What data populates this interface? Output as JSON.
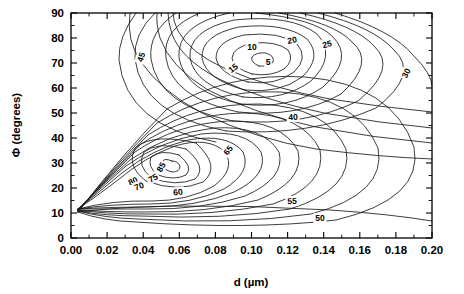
{
  "figure": {
    "background": "#ffffff",
    "line_color": "#1a1a1a",
    "plot_box": {
      "left": 71,
      "right": 432,
      "top": 13,
      "bottom": 238
    }
  },
  "axes": {
    "x_title": "d (µm)",
    "y_title": "Φ (degrees)",
    "x_ticks": [
      "0.00",
      "0.02",
      "0.04",
      "0.06",
      "0.08",
      "0.10",
      "0.12",
      "0.14",
      "0.16",
      "0.18",
      "0.20"
    ],
    "y_ticks": [
      "0",
      "10",
      "20",
      "30",
      "40",
      "50",
      "60",
      "70",
      "80",
      "90"
    ]
  },
  "chart_data": {
    "type": "contour",
    "title": "",
    "xlabel": "d (µm)",
    "ylabel": "Φ (degrees)",
    "xlim": [
      0.0,
      0.2
    ],
    "ylim": [
      0,
      90
    ],
    "xtick_values": [
      0.0,
      0.02,
      0.04,
      0.06,
      0.08,
      0.1,
      0.12,
      0.14,
      0.16,
      0.18,
      0.2
    ],
    "ytick_values": [
      0,
      10,
      20,
      30,
      40,
      50,
      60,
      70,
      80,
      90
    ],
    "grid": false,
    "legend": null,
    "minor_ticks_per_interval": 1,
    "contour_levels": [
      5,
      10,
      15,
      20,
      25,
      30,
      40,
      45,
      50,
      55,
      60,
      65,
      70,
      75,
      80,
      85
    ],
    "level_label_texts": [
      "5",
      "10",
      "15",
      "20",
      "25",
      "30",
      "40",
      "45",
      "50",
      "55",
      "60",
      "65",
      "70",
      "75",
      "80",
      "85"
    ],
    "extrema": [
      {
        "kind": "minimum",
        "label": "5",
        "x": 0.104,
        "y": 71.5,
        "note": "upper closed minimum basin"
      },
      {
        "kind": "minimum",
        "label": "85",
        "x": 0.051,
        "y": 28.0,
        "note": "lower closed maximum basin"
      },
      {
        "kind": "singular-point",
        "x": 0.007,
        "y": 15.0,
        "note": "all contours converge at left pinch point"
      }
    ],
    "labels": [
      {
        "text": "45",
        "x_px": 141,
        "y_px": 57,
        "rotation": -72
      },
      {
        "text": "10",
        "x_px": 252,
        "y_px": 47,
        "rotation": 0
      },
      {
        "text": "5",
        "x_px": 268,
        "y_px": 62,
        "rotation": 0
      },
      {
        "text": "15",
        "x_px": 233,
        "y_px": 68,
        "rotation": -38
      },
      {
        "text": "20",
        "x_px": 292,
        "y_px": 40,
        "rotation": -12
      },
      {
        "text": "25",
        "x_px": 327,
        "y_px": 44,
        "rotation": -14
      },
      {
        "text": "30",
        "x_px": 406,
        "y_px": 73,
        "rotation": -62
      },
      {
        "text": "40",
        "x_px": 293,
        "y_px": 117,
        "rotation": -3
      },
      {
        "text": "65",
        "x_px": 228,
        "y_px": 150,
        "rotation": -52
      },
      {
        "text": "85",
        "x_px": 161,
        "y_px": 167,
        "rotation": -60
      },
      {
        "text": "75",
        "x_px": 153,
        "y_px": 178,
        "rotation": -30
      },
      {
        "text": "80",
        "x_px": 133,
        "y_px": 181,
        "rotation": -26
      },
      {
        "text": "70",
        "x_px": 139,
        "y_px": 186,
        "rotation": -22
      },
      {
        "text": "60",
        "x_px": 178,
        "y_px": 192,
        "rotation": -6
      },
      {
        "text": "55",
        "x_px": 292,
        "y_px": 201,
        "rotation": -3
      },
      {
        "text": "50",
        "x_px": 320,
        "y_px": 218,
        "rotation": 0
      }
    ]
  }
}
